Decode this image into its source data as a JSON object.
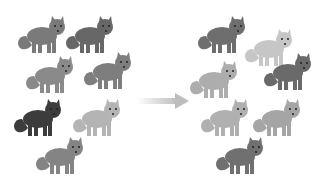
{
  "diagram": {
    "arrow_icon": "right-arrow-icon",
    "left_group": {
      "label": "before",
      "foxes": [
        {
          "x": 16,
          "y": 14,
          "color": "#7a7a7a"
        },
        {
          "x": 64,
          "y": 14,
          "color": "#676767"
        },
        {
          "x": 24,
          "y": 54,
          "color": "#8a8a8a"
        },
        {
          "x": 82,
          "y": 50,
          "color": "#7e7e7e"
        },
        {
          "x": 12,
          "y": 97,
          "color": "#3c3c3c"
        },
        {
          "x": 71,
          "y": 97,
          "color": "#b4b4b4"
        },
        {
          "x": 34,
          "y": 135,
          "color": "#848484"
        }
      ]
    },
    "right_group": {
      "label": "after",
      "foxes": [
        {
          "x": 196,
          "y": 14,
          "color": "#6e6e6e"
        },
        {
          "x": 243,
          "y": 27,
          "color": "#c6c6c6"
        },
        {
          "x": 188,
          "y": 59,
          "color": "#adadad"
        },
        {
          "x": 262,
          "y": 51,
          "color": "#6a6a6a"
        },
        {
          "x": 199,
          "y": 97,
          "color": "#b0b0b0"
        },
        {
          "x": 251,
          "y": 97,
          "color": "#a5a5a5"
        },
        {
          "x": 214,
          "y": 135,
          "color": "#707070"
        }
      ]
    },
    "arrow_color": "#c8c8c8"
  }
}
